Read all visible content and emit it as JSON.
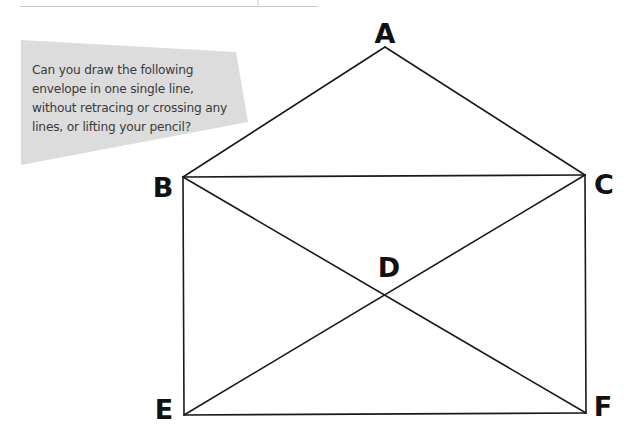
{
  "prompt": {
    "lines": [
      "Can you draw the following",
      "envelope in one single line,",
      "without retracing or crossing any",
      "lines, or lifting your pencil?"
    ]
  },
  "figure": {
    "vertices": [
      {
        "id": "A",
        "label": "A"
      },
      {
        "id": "B",
        "label": "B"
      },
      {
        "id": "C",
        "label": "C"
      },
      {
        "id": "D",
        "label": "D"
      },
      {
        "id": "E",
        "label": "E"
      },
      {
        "id": "F",
        "label": "F"
      }
    ],
    "edges": [
      [
        "A",
        "B"
      ],
      [
        "A",
        "C"
      ],
      [
        "B",
        "C"
      ],
      [
        "B",
        "E"
      ],
      [
        "C",
        "F"
      ],
      [
        "E",
        "F"
      ],
      [
        "B",
        "F"
      ],
      [
        "C",
        "E"
      ]
    ],
    "colors": {
      "line": "#1a1a1a",
      "label": "#111111",
      "callout": "#dcdcdc",
      "rule": "#c8c8c8"
    }
  }
}
